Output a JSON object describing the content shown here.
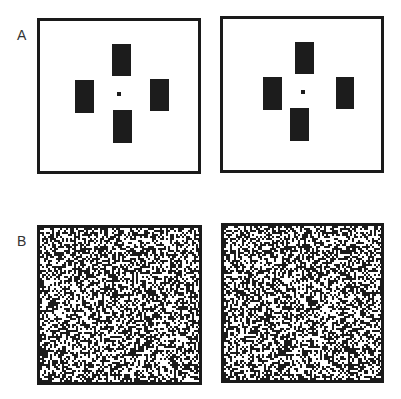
{
  "figure": {
    "panel_a": {
      "label": "A",
      "description": "Stereo half-image pair: four dark rectangles around a central fixation dot",
      "left_image": {
        "rects": [
          {
            "name": "top",
            "x": 112,
            "y": 44,
            "w": 19,
            "h": 32
          },
          {
            "name": "left",
            "x": 75,
            "y": 80,
            "w": 19,
            "h": 33
          },
          {
            "name": "right",
            "x": 150,
            "y": 79,
            "w": 19,
            "h": 32
          },
          {
            "name": "bottom",
            "x": 113,
            "y": 110,
            "w": 19,
            "h": 33
          }
        ],
        "fixation_dot": {
          "x": 117,
          "y": 92,
          "size": 4
        }
      },
      "right_image": {
        "rects": [
          {
            "name": "top",
            "x": 295,
            "y": 42,
            "w": 19,
            "h": 32
          },
          {
            "name": "left",
            "x": 263,
            "y": 77,
            "w": 19,
            "h": 33
          },
          {
            "name": "right",
            "x": 336,
            "y": 77,
            "w": 18,
            "h": 32
          },
          {
            "name": "bottom",
            "x": 290,
            "y": 108,
            "w": 19,
            "h": 33
          }
        ],
        "fixation_dot": {
          "x": 301,
          "y": 90,
          "size": 4
        }
      }
    },
    "panel_b": {
      "label": "B",
      "description": "Random-dot stereogram pair",
      "dot_size_px": 2,
      "density": 0.5,
      "seed": 12345
    },
    "colors": {
      "ink": "#1c1c1c",
      "background": "#ffffff",
      "label": "#333333"
    }
  }
}
